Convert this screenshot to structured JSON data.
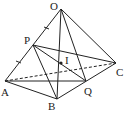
{
  "diagram": {
    "points": {
      "O": {
        "label": "O",
        "x": 61,
        "y": 9
      },
      "A": {
        "label": "A",
        "x": 5,
        "y": 81
      },
      "B": {
        "label": "B",
        "x": 57,
        "y": 99
      },
      "C": {
        "label": "C",
        "x": 116,
        "y": 63
      },
      "P": {
        "label": "P",
        "x": 33,
        "y": 45
      },
      "Q": {
        "label": "Q",
        "x": 86,
        "y": 81
      },
      "I": {
        "label": "I",
        "x": 61,
        "y": 63
      }
    },
    "solid_edges": [
      [
        "O",
        "A"
      ],
      [
        "O",
        "B"
      ],
      [
        "O",
        "C"
      ],
      [
        "A",
        "B"
      ],
      [
        "B",
        "C"
      ],
      [
        "P",
        "B"
      ],
      [
        "P",
        "C"
      ],
      [
        "P",
        "Q"
      ],
      [
        "O",
        "Q"
      ],
      [
        "A",
        "Q"
      ]
    ],
    "dashed_edges": [
      [
        "A",
        "C"
      ]
    ],
    "tick_marks": [
      "OP",
      "PA"
    ]
  }
}
